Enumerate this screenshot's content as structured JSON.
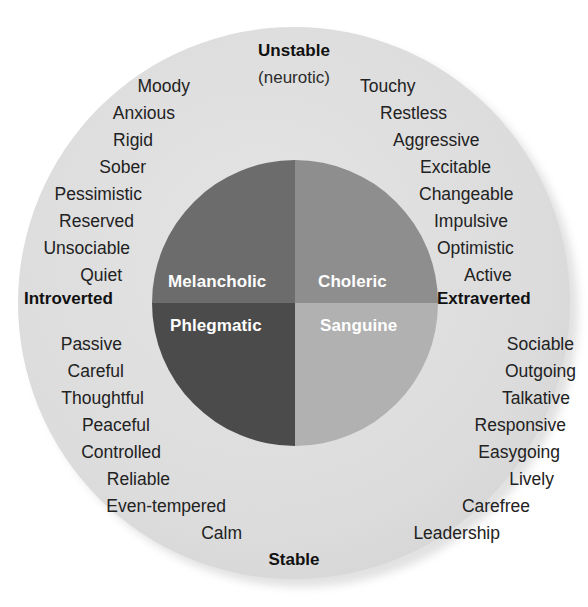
{
  "figure": {
    "type": "eysenck-personality-circumplex",
    "title_visible": false,
    "colors": {
      "outer_ring": "#dcdcdc",
      "melancholic": "#6c6c6c",
      "choleric": "#8e8e8e",
      "phlegmatic": "#4b4b4b",
      "sanguine": "#b1b1b1",
      "text": "#222222",
      "quadrant_label_text": "#ffffff",
      "background": "#ffffff"
    }
  },
  "axes": {
    "top": {
      "label": "Unstable",
      "sublabel": "(neurotic)"
    },
    "bottom": {
      "label": "Stable",
      "sublabel": ""
    },
    "left": {
      "label": "Introverted",
      "sublabel": ""
    },
    "right": {
      "label": "Extraverted",
      "sublabel": ""
    }
  },
  "quadrants": {
    "melancholic": {
      "label": "Melancholic",
      "position": "top-left",
      "color": "#6c6c6c",
      "traits": [
        "Moody",
        "Anxious",
        "Rigid",
        "Sober",
        "Pessimistic",
        "Reserved",
        "Unsociable",
        "Quiet"
      ]
    },
    "choleric": {
      "label": "Choleric",
      "position": "top-right",
      "color": "#8e8e8e",
      "traits": [
        "Touchy",
        "Restless",
        "Aggressive",
        "Excitable",
        "Changeable",
        "Impulsive",
        "Optimistic",
        "Active"
      ]
    },
    "phlegmatic": {
      "label": "Phlegmatic",
      "position": "bottom-left",
      "color": "#4b4b4b",
      "traits": [
        "Passive",
        "Careful",
        "Thoughtful",
        "Peaceful",
        "Controlled",
        "Reliable",
        "Even-tempered",
        "Calm"
      ]
    },
    "sanguine": {
      "label": "Sanguine",
      "position": "bottom-right",
      "color": "#b1b1b1",
      "traits": [
        "Sociable",
        "Outgoing",
        "Talkative",
        "Responsive",
        "Easygoing",
        "Lively",
        "Carefree",
        "Leadership"
      ]
    }
  }
}
